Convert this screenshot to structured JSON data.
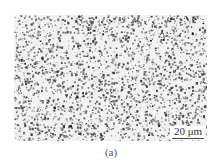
{
  "figure": {
    "panel_label": "(a)",
    "scale_bar": {
      "label": "20 μm"
    },
    "image": {
      "description": "grayscale optical micrograph with dense dark speckled particles on light background",
      "colors": {
        "background": "#ffffff",
        "particles": "#1a1a1a",
        "mid": "#7a7a7a"
      }
    }
  }
}
